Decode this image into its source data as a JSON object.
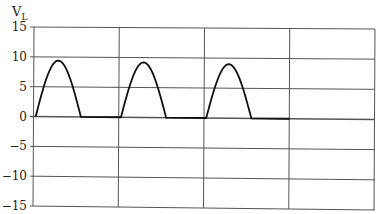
{
  "chart_data": {
    "type": "line",
    "title": "",
    "xlabel": "",
    "ylabel": "V_L",
    "ylabel_main": "V",
    "ylabel_sub": "L",
    "ylim": [
      -15,
      15
    ],
    "yticks": [
      15,
      10,
      5,
      0,
      -5,
      -10,
      -15
    ],
    "ytick_labels": [
      "15",
      "10",
      "5",
      "0",
      "−5",
      "−10",
      "−15"
    ],
    "x_divisions": 4,
    "grid": true,
    "legend": null,
    "series": [
      {
        "name": "V_L (half-wave rectified sine)",
        "peak": 9.3,
        "cycles_shown": 3,
        "description": "Three positive half-cycles of a sine wave (peak ~9.3), zero between pulses; trace ends after 3rd grid column",
        "points": [
          {
            "x": 0.0,
            "y": 0
          },
          {
            "x": 0.13,
            "y": 6.6
          },
          {
            "x": 0.265,
            "y": 9.4
          },
          {
            "x": 0.4,
            "y": 6.6
          },
          {
            "x": 0.55,
            "y": 0
          },
          {
            "x": 1.0,
            "y": 0
          },
          {
            "x": 1.0,
            "y": 0
          },
          {
            "x": 1.13,
            "y": 6.5
          },
          {
            "x": 1.265,
            "y": 9.2
          },
          {
            "x": 1.4,
            "y": 6.5
          },
          {
            "x": 1.55,
            "y": 0
          },
          {
            "x": 2.0,
            "y": 0
          },
          {
            "x": 2.0,
            "y": 0
          },
          {
            "x": 2.13,
            "y": 6.4
          },
          {
            "x": 2.265,
            "y": 9.0
          },
          {
            "x": 2.4,
            "y": 6.4
          },
          {
            "x": 2.55,
            "y": 0
          },
          {
            "x": 3.0,
            "y": 0
          }
        ]
      }
    ]
  },
  "colors": {
    "grid": "#555555",
    "trace": "#111111",
    "text": "#222222"
  }
}
